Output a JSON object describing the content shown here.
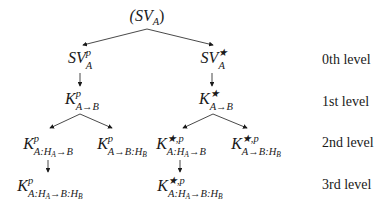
{
  "tree": {
    "root": {
      "text": "(SV",
      "sub": "A",
      "close": ")"
    },
    "level0": [
      {
        "base": "SV",
        "sup": "p",
        "sub": "A"
      },
      {
        "base": "SV",
        "sup": "★",
        "sub": "A"
      }
    ],
    "level1": [
      {
        "base": "K",
        "sup": "p",
        "sub_a": "A→B",
        "sub_h": "",
        "sub_b": ""
      },
      {
        "base": "K",
        "sup": "★",
        "sub_a": "A→B",
        "sub_h": "",
        "sub_b": ""
      }
    ],
    "level2": [
      {
        "base": "K",
        "sup": "p",
        "sub_pre": "A:H",
        "sub_h": "A",
        "sub_post": "→B"
      },
      {
        "base": "K",
        "sup": "p",
        "sub_pre": "A→B:H",
        "sub_h": "B",
        "sub_post": ""
      },
      {
        "base": "K",
        "sup": "★,p",
        "sub_pre": "A:H",
        "sub_h": "A",
        "sub_post": "→B"
      },
      {
        "base": "K",
        "sup": "★,p",
        "sub_pre": "A→B:H",
        "sub_h": "B",
        "sub_post": ""
      }
    ],
    "level3": [
      {
        "base": "K",
        "sup": "p",
        "sub_pre": "A:H",
        "sub_h": "A",
        "sub_mid": "→B:H",
        "sub_h2": "B"
      },
      {
        "base": "K",
        "sup": "★,p",
        "sub_pre": "A:H",
        "sub_h": "A",
        "sub_mid": "→B:H",
        "sub_h2": "B"
      }
    ]
  },
  "levels": [
    "0th level",
    "1st level",
    "2nd level",
    "3rd level"
  ],
  "colors": {
    "ink": "#1a1a1a",
    "background": "#ffffff"
  }
}
